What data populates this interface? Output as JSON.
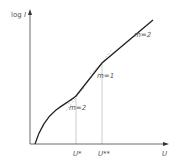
{
  "diagram": {
    "y_axis_label": "log I",
    "y_axis_label_log": "log",
    "y_axis_label_var": "I",
    "x_axis_label": "U",
    "markers": [
      {
        "label": "U*",
        "x": 76
      },
      {
        "label": "U**",
        "x": 102
      }
    ],
    "slope_labels": [
      {
        "text": "m=2",
        "region": "upper"
      },
      {
        "text": "m=1",
        "region": "middle"
      },
      {
        "text": "m=2",
        "region": "lower"
      }
    ],
    "colors": {
      "axis": "#444444",
      "curve": "#222222",
      "guide": "#aaaaaa",
      "text": "#555555"
    }
  }
}
